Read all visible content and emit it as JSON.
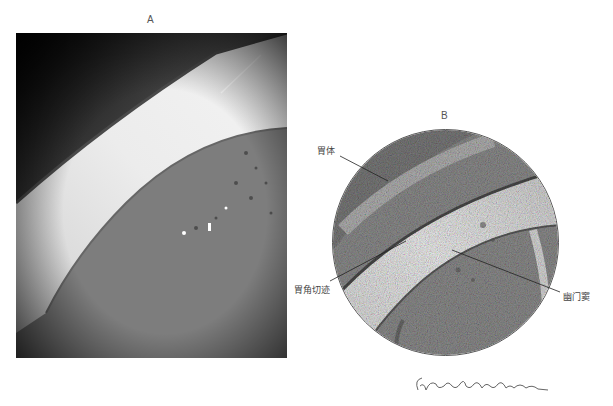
{
  "figure": {
    "panel_a": {
      "label": "A",
      "type": "endoscopic-photograph"
    },
    "panel_b": {
      "label": "B",
      "type": "endoscopic-illustration",
      "annotations": [
        {
          "id": "gastric-body",
          "text": "胃体"
        },
        {
          "id": "angular-incisure",
          "text": "胃角切迹"
        },
        {
          "id": "pyloric-antrum",
          "text": "幽门窦"
        }
      ]
    },
    "signature": {
      "text": "G.A. Constantinescu"
    }
  },
  "colors": {
    "background": "#ffffff",
    "photo_dark": "#1a1a1a",
    "photo_fold": "#e6e6e6",
    "drawing_base": "#8a8a8a",
    "leader_line": "#222222",
    "text": "#444444"
  }
}
